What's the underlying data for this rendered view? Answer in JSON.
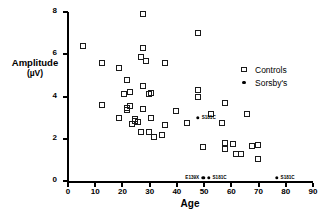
{
  "chart_data": {
    "type": "scatter",
    "title": "",
    "xlabel": "Age",
    "ylabel": "Amplitude (µV)",
    "ylabel_main": "Amplitude",
    "ylabel_unit": "(µV)",
    "xlim": [
      0,
      90
    ],
    "ylim": [
      0,
      8
    ],
    "xticks": [
      0,
      10,
      20,
      30,
      40,
      50,
      60,
      70,
      80,
      90
    ],
    "yticks": [
      0,
      2,
      4,
      6,
      8
    ],
    "grid": false,
    "legend_position": "upper-right",
    "legend": [
      {
        "name": "Controls",
        "marker": "open-square",
        "color": "#1a1a1a"
      },
      {
        "name": "Sorsby's",
        "marker": "filled-circle",
        "color": "#000000"
      }
    ],
    "series": [
      {
        "name": "Controls",
        "marker": "open-square",
        "points": [
          {
            "x": 6,
            "y": 6.4
          },
          {
            "x": 13,
            "y": 5.6
          },
          {
            "x": 13,
            "y": 3.6
          },
          {
            "x": 19,
            "y": 5.35
          },
          {
            "x": 19,
            "y": 3.0
          },
          {
            "x": 21,
            "y": 4.1
          },
          {
            "x": 22,
            "y": 4.8
          },
          {
            "x": 22,
            "y": 3.45
          },
          {
            "x": 22,
            "y": 3.35
          },
          {
            "x": 23,
            "y": 4.2
          },
          {
            "x": 23,
            "y": 3.55
          },
          {
            "x": 24,
            "y": 2.7
          },
          {
            "x": 25,
            "y": 2.85
          },
          {
            "x": 25,
            "y": 2.95
          },
          {
            "x": 26,
            "y": 2.8
          },
          {
            "x": 27,
            "y": 2.3
          },
          {
            "x": 27,
            "y": 5.85
          },
          {
            "x": 28,
            "y": 7.9
          },
          {
            "x": 28,
            "y": 6.3
          },
          {
            "x": 28,
            "y": 4.5
          },
          {
            "x": 28,
            "y": 3.4
          },
          {
            "x": 29,
            "y": 5.7
          },
          {
            "x": 30,
            "y": 4.1
          },
          {
            "x": 30,
            "y": 2.3
          },
          {
            "x": 31,
            "y": 4.15
          },
          {
            "x": 31,
            "y": 3.0
          },
          {
            "x": 32,
            "y": 2.1
          },
          {
            "x": 35,
            "y": 2.2
          },
          {
            "x": 36,
            "y": 5.6
          },
          {
            "x": 36,
            "y": 2.65
          },
          {
            "x": 40,
            "y": 3.3
          },
          {
            "x": 44,
            "y": 2.75
          },
          {
            "x": 48,
            "y": 4.3
          },
          {
            "x": 48,
            "y": 4.0
          },
          {
            "x": 48,
            "y": 7.0
          },
          {
            "x": 50,
            "y": 1.6
          },
          {
            "x": 53,
            "y": 3.15
          },
          {
            "x": 57,
            "y": 2.75
          },
          {
            "x": 58,
            "y": 3.7
          },
          {
            "x": 58,
            "y": 1.5
          },
          {
            "x": 58,
            "y": 1.8
          },
          {
            "x": 61,
            "y": 1.75
          },
          {
            "x": 62,
            "y": 1.3
          },
          {
            "x": 64,
            "y": 1.3
          },
          {
            "x": 66,
            "y": 3.15
          },
          {
            "x": 68,
            "y": 1.65
          },
          {
            "x": 70,
            "y": 1.7
          },
          {
            "x": 70,
            "y": 1.05
          }
        ]
      },
      {
        "name": "Sorsby's",
        "marker": "filled-circle",
        "points": [
          {
            "x": 48,
            "y": 3.0,
            "label": "S181C",
            "label_side": "right"
          },
          {
            "x": 50,
            "y": 0.15,
            "label": "E139X",
            "label_side": "left"
          },
          {
            "x": 52,
            "y": 0.15,
            "label": "S181C",
            "label_side": "right"
          },
          {
            "x": 77,
            "y": 0.15,
            "label": "S181C",
            "label_side": "right"
          }
        ]
      }
    ]
  }
}
